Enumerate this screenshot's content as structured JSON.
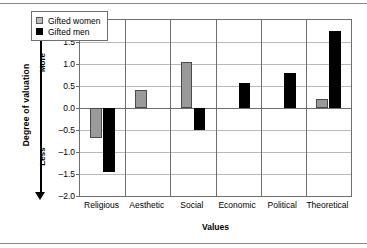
{
  "chart_data": {
    "type": "bar",
    "title": "",
    "xlabel": "Values",
    "ylabel": "Degree of valuation",
    "categories": [
      "Religious",
      "Aesthetic",
      "Social",
      "Economic",
      "Political",
      "Theoretical"
    ],
    "series": [
      {
        "name": "Gifted women",
        "color": "#9a9a9a",
        "values": [
          -0.68,
          0.42,
          1.05,
          null,
          null,
          0.2
        ]
      },
      {
        "name": "Gifted men",
        "color": "#000000",
        "values": [
          -1.45,
          null,
          -0.5,
          0.56,
          0.8,
          1.75
        ]
      }
    ],
    "ylim": [
      -2.0,
      2.0
    ],
    "ytick_labels": [
      "2.0",
      "1.5",
      "1.0",
      "0.5",
      "0.0",
      "–0.5",
      "–1.0",
      "–1.5",
      "–2.0"
    ],
    "ytick_values": [
      2.0,
      1.5,
      1.0,
      0.5,
      0.0,
      -0.5,
      -1.0,
      -1.5,
      -2.0
    ],
    "grid": true,
    "legend_position": "top-left",
    "axis_arrow": {
      "top_label": "More",
      "bottom_label": "Less"
    }
  }
}
